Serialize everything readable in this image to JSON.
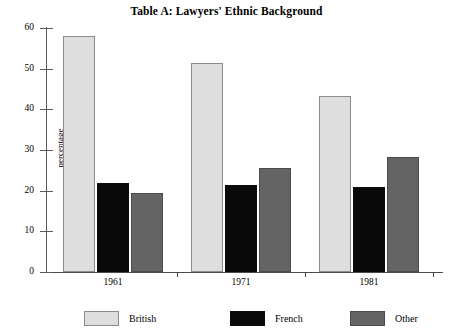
{
  "chart_data": {
    "type": "bar",
    "title": "Table A: Lawyers' Ethnic Background",
    "xlabel": "",
    "ylabel": "percentage",
    "categories": [
      "1961",
      "1971",
      "1981"
    ],
    "series": [
      {
        "name": "British",
        "color": "#dedede",
        "values": [
          58,
          51.5,
          43.2
        ]
      },
      {
        "name": "French",
        "color": "#0a0a0a",
        "values": [
          22,
          21.5,
          21
        ]
      },
      {
        "name": "Other",
        "color": "#646464",
        "values": [
          19.5,
          25.5,
          28.2
        ]
      }
    ],
    "ylim": [
      0,
      60
    ],
    "yticks": [
      0,
      10,
      20,
      30,
      40,
      50,
      60
    ],
    "ytick_labels": [
      "0",
      "10",
      "20",
      "30",
      "40",
      "50",
      "60"
    ],
    "grid": false,
    "legend_position": "bottom"
  }
}
